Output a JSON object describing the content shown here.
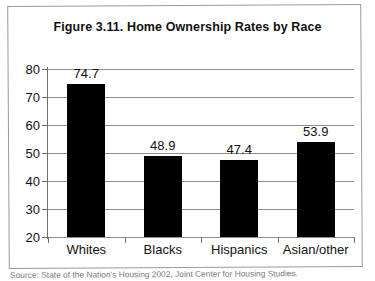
{
  "figure": {
    "title": "Figure 3.11.  Home Ownership Rates by Race",
    "source": "Source: State of the Nation's Housing 2002, Joint Center for Housing Studies."
  },
  "chart_data": {
    "type": "bar",
    "title": "Figure 3.11.  Home Ownership Rates by Race",
    "xlabel": "",
    "ylabel": "",
    "categories": [
      "Whites",
      "Blacks",
      "Hispanics",
      "Asian/other"
    ],
    "values": [
      74.7,
      48.9,
      47.4,
      53.9
    ],
    "value_labels": [
      "74.7",
      "48.9",
      "47.4",
      "53.9"
    ],
    "ylim": [
      20,
      80
    ],
    "yticks": [
      20,
      30,
      40,
      50,
      60,
      70,
      80
    ],
    "ytick_labels": [
      "20",
      "30",
      "40",
      "50",
      "60",
      "70",
      "80"
    ],
    "grid": true,
    "legend": false,
    "bar_color": "#000000",
    "grid_color": "#8e8e8e"
  }
}
